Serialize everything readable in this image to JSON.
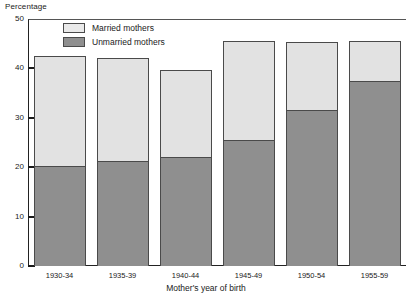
{
  "chart_data": {
    "type": "bar",
    "stacked": true,
    "title": "",
    "xlabel": "Mother's year of birth",
    "ylabel": "Percentage",
    "ylim": [
      0,
      50
    ],
    "yticks": [
      0,
      10,
      20,
      30,
      40,
      50
    ],
    "ytick_labels": [
      "0",
      "10",
      "20",
      "30",
      "40",
      "50"
    ],
    "grid": false,
    "legend_position": "top-left-inside",
    "categories": [
      "1930-34",
      "1935-39",
      "1940-44",
      "1945-49",
      "1950-54",
      "1955-59"
    ],
    "series": [
      {
        "name": "Unmarried mothers",
        "color": "#8f8f8f",
        "values": [
          20.2,
          21.2,
          22.0,
          25.5,
          31.5,
          37.5
        ]
      },
      {
        "name": "Married mothers",
        "color": "#e2e2e2",
        "values": [
          22.3,
          21.0,
          17.7,
          20.0,
          13.8,
          8.0
        ]
      }
    ],
    "totals": [
      42.5,
      42.2,
      39.7,
      45.5,
      45.3,
      45.5
    ]
  },
  "axes": {
    "y_title": "Percentage",
    "x_title": "Mother's year of birth"
  },
  "legend": {
    "items": [
      {
        "label": "Married mothers",
        "swatch": "married"
      },
      {
        "label": "Unmarried mothers",
        "swatch": "unmarried"
      }
    ]
  }
}
